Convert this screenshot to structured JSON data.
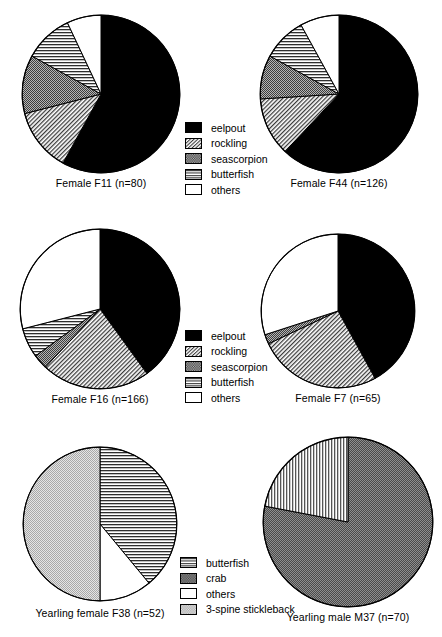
{
  "figure": {
    "type": "pie-chart-grid",
    "rows": 3,
    "columns": 2,
    "background": "#ffffff",
    "stroke": "#000000"
  },
  "patterns": {
    "eelpout": {
      "key": "solid-black",
      "fill": "#000000",
      "description": "solid black"
    },
    "rockling": {
      "key": "diagonal-hatch",
      "fill": "#c8c8c8",
      "description": "fine diagonal hatching"
    },
    "seascorpion": {
      "key": "medium-gray-stipple",
      "fill": "#989898",
      "description": "medium grey stipple"
    },
    "butterfish": {
      "key": "horizontal-lines",
      "fill": "#bdbdbd",
      "description": "horizontal line fill"
    },
    "others": {
      "key": "white-empty",
      "fill": "#ffffff",
      "description": "white / empty"
    },
    "crab": {
      "key": "dark-gray-stipple",
      "fill": "#6e6e6e",
      "description": "dark grey stipple"
    },
    "3-spine stickleback": {
      "key": "light-gray-stipple",
      "fill": "#d6d6d6",
      "description": "light grey stipple"
    },
    "butterfish-vertical": {
      "key": "vertical-lines",
      "fill": "#bdbdbd",
      "description": "vertical line fill"
    }
  },
  "legends": [
    {
      "id": "legend-top",
      "items": [
        {
          "label": "eelpout",
          "pattern": "solid-black"
        },
        {
          "label": "rockling",
          "pattern": "diagonal-hatch"
        },
        {
          "label": "seascorpion",
          "pattern": "medium-gray-stipple"
        },
        {
          "label": "butterfish",
          "pattern": "horizontal-lines"
        },
        {
          "label": "others",
          "pattern": "white-empty"
        }
      ]
    },
    {
      "id": "legend-middle",
      "items": [
        {
          "label": "eelpout",
          "pattern": "solid-black"
        },
        {
          "label": "rockling",
          "pattern": "diagonal-hatch"
        },
        {
          "label": "seascorpion",
          "pattern": "medium-gray-stipple"
        },
        {
          "label": "butterfish",
          "pattern": "horizontal-lines"
        },
        {
          "label": "others",
          "pattern": "white-empty"
        }
      ]
    },
    {
      "id": "legend-bottom",
      "items": [
        {
          "label": "butterfish",
          "pattern": "horizontal-lines"
        },
        {
          "label": "crab",
          "pattern": "dark-gray-stipple"
        },
        {
          "label": "others",
          "pattern": "white-empty"
        },
        {
          "label": "3-spine stickleback",
          "pattern": "light-gray-stipple"
        }
      ]
    }
  ],
  "chart_data": [
    {
      "id": "pie-f11",
      "type": "pie",
      "title": "Female F11 (n=80)",
      "subject": "Female F11",
      "n": 80,
      "start_angle_deg": 0,
      "direction": "clockwise",
      "categories": [
        "eelpout",
        "rockling",
        "seascorpion",
        "butterfish",
        "others"
      ],
      "values": [
        58,
        13,
        12,
        10,
        7
      ],
      "unit": "percent",
      "patterns": [
        "solid-black",
        "diagonal-hatch",
        "medium-gray-stipple",
        "horizontal-lines",
        "white-empty"
      ]
    },
    {
      "id": "pie-f44",
      "type": "pie",
      "title": "Female F44 (n=126)",
      "subject": "Female F44",
      "n": 126,
      "start_angle_deg": 0,
      "direction": "clockwise",
      "categories": [
        "eelpout",
        "rockling",
        "seascorpion",
        "butterfish",
        "others"
      ],
      "values": [
        62,
        12,
        9,
        9,
        8
      ],
      "unit": "percent",
      "patterns": [
        "solid-black",
        "diagonal-hatch",
        "medium-gray-stipple",
        "horizontal-lines",
        "white-empty"
      ]
    },
    {
      "id": "pie-f16",
      "type": "pie",
      "title": "Female F16 (n=166)",
      "subject": "Female F16",
      "n": 166,
      "start_angle_deg": 0,
      "direction": "clockwise",
      "categories": [
        "eelpout",
        "rockling",
        "seascorpion",
        "butterfish",
        "others"
      ],
      "values": [
        40,
        22,
        3,
        6,
        29
      ],
      "unit": "percent",
      "patterns": [
        "solid-black",
        "diagonal-hatch",
        "medium-gray-stipple",
        "horizontal-lines",
        "white-empty"
      ]
    },
    {
      "id": "pie-f7",
      "type": "pie",
      "title": "Female F7 (n=65)",
      "subject": "Female F7",
      "n": 65,
      "start_angle_deg": 0,
      "direction": "clockwise",
      "categories": [
        "eelpout",
        "rockling",
        "seascorpion",
        "butterfish",
        "others"
      ],
      "values": [
        42,
        26,
        2,
        0,
        30
      ],
      "unit": "percent",
      "patterns": [
        "solid-black",
        "diagonal-hatch",
        "medium-gray-stipple",
        "horizontal-lines",
        "white-empty"
      ]
    },
    {
      "id": "pie-f38",
      "type": "pie",
      "title": "Yearling female F38 (n=52)",
      "subject": "Yearling female F38",
      "n": 52,
      "start_angle_deg": 0,
      "direction": "clockwise",
      "categories": [
        "butterfish",
        "others",
        "3-spine stickleback"
      ],
      "values": [
        39,
        11,
        50
      ],
      "unit": "percent",
      "patterns": [
        "horizontal-lines",
        "white-empty",
        "light-gray-stipple"
      ]
    },
    {
      "id": "pie-m37",
      "type": "pie",
      "title": "Yearling male M37 (n=70)",
      "subject": "Yearling male M37",
      "n": 70,
      "start_angle_deg": 0,
      "direction": "clockwise",
      "categories": [
        "crab",
        "butterfish"
      ],
      "values": [
        78,
        22
      ],
      "unit": "percent",
      "patterns": [
        "dark-gray-stipple",
        "vertical-lines"
      ]
    }
  ]
}
